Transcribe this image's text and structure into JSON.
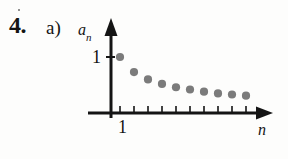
{
  "exercise": {
    "number_label": "4.",
    "part_label": "a)"
  },
  "figure": {
    "y_axis_label": "a",
    "y_axis_label_sub": "n",
    "x_axis_label": "n",
    "y_tick_label": "1",
    "x_tick_label": "1",
    "axis_color": "#141414",
    "point_color": "#7b7b7b",
    "background_color": "#fdfdfc"
  },
  "chart_data": {
    "type": "scatter",
    "title": "",
    "xlabel": "n",
    "ylabel": "a_n",
    "x": [
      1,
      2,
      3,
      4,
      5,
      6,
      7,
      8,
      9,
      10
    ],
    "values": [
      1.0,
      0.73,
      0.6,
      0.52,
      0.46,
      0.42,
      0.38,
      0.35,
      0.33,
      0.31
    ],
    "xticklabels": [
      "1"
    ],
    "yticklabels": [
      "1"
    ],
    "xlim": [
      0,
      11.5
    ],
    "ylim": [
      0,
      1.28
    ],
    "grid": false,
    "legend": null,
    "marker": "filled-circle",
    "marker_color": "#7b7b7b"
  }
}
